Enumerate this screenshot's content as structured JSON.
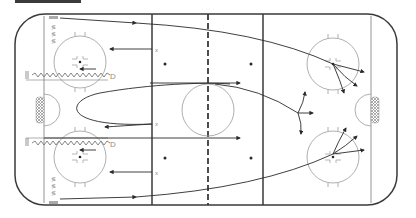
{
  "diagram": {
    "type": "hockey-drill",
    "colors": {
      "boards": "#3a3a3a",
      "lines": "#3a3a3a",
      "circles": "#9a9a9a",
      "paths": "#2a2a2a",
      "labels": "#8a8a8a",
      "crease_fill": "#bcbcbc"
    },
    "labels": {
      "defense_top": "D",
      "defense_bottom": "D",
      "forward_marker": "x"
    },
    "elements": {
      "rink": "full ice rink outline with rounded corners",
      "goal_lines": 2,
      "blue_lines": 2,
      "center_red_line": "dashed",
      "faceoff_circles": 5,
      "neutral_zone_dots": 4,
      "goals": 2
    }
  }
}
